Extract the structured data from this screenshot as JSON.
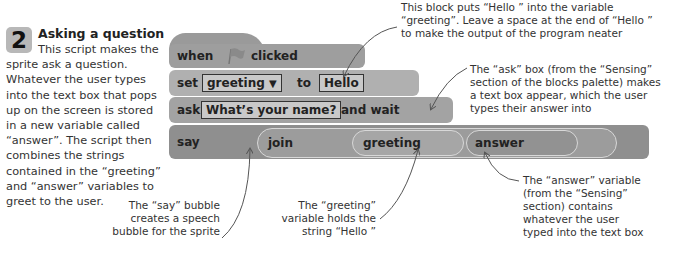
{
  "step": {
    "number": "2",
    "title": "Asking a question",
    "intro_first_line": "This script makes the",
    "intro_rest": "sprite ask a question. Whatever the user types into the text box that pops up on the screen is stored in a new variable called “answer”. The script then combines the strings contained in the “greeting” and “answer” variables to greet to the user."
  },
  "script": {
    "when_block": {
      "word_when": "when",
      "icon": "green-flag-icon",
      "word_clicked": "clicked"
    },
    "set_block": {
      "word_set": "set",
      "variable": "greeting",
      "dropdown_icon": "▼",
      "word_to": "to",
      "value": "Hello"
    },
    "ask_block": {
      "word_ask": "ask",
      "question": "What’s your name?",
      "word_and_wait": "and wait"
    },
    "say_block": {
      "word_say": "say",
      "join": "join",
      "arg1": "greeting",
      "arg2": "answer"
    }
  },
  "annotations": {
    "set_note": [
      "This block puts “Hello ” into the variable",
      "“greeting”. Leave a space at the end of “Hello ”",
      "to make the output of the program neater"
    ],
    "ask_note": [
      "The “ask” box (from the “Sensing”",
      "section of the blocks palette) makes",
      "a text box appear, which the user",
      "types their answer into"
    ],
    "say_note": [
      "The “say” bubble",
      "creates a speech",
      "bubble for the sprite"
    ],
    "greeting_note": [
      "The “greeting”",
      "variable holds the",
      "string “Hello ”"
    ],
    "answer_note": [
      "The “answer” variable",
      "(from the “Sensing”",
      "section) contains",
      "whatever the user",
      "typed into the text box"
    ]
  },
  "colors": {
    "badge": "#b8b8b8",
    "event_block": "#9e9e9e",
    "variable_block": "#b0b0b0",
    "sensing_block": "#a3a3a3",
    "looks_block": "#8f8f8f",
    "arrow": "#555555"
  }
}
